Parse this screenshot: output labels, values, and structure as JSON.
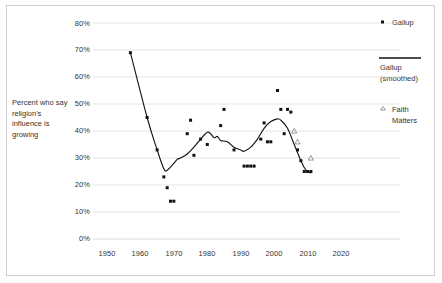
{
  "figure": {
    "background_color": "#ffffff",
    "frame_color": "#cfcfcf",
    "marker_color": "#111111",
    "line_color": "#111111",
    "gridline_color": "#d8d8d8"
  },
  "axes": {
    "y_title": "Percent who say religion's influence is growing",
    "y_ticks": [
      "0%",
      "10%",
      "20%",
      "30%",
      "40%",
      "50%",
      "60%",
      "70%",
      "80%"
    ],
    "x_ticks": [
      "1950",
      "1960",
      "1970",
      "1980",
      "1990",
      "2000",
      "2010",
      "2020"
    ]
  },
  "legend": {
    "items": [
      {
        "label": "Gallup",
        "marker": "square-marker"
      },
      {
        "label": "Gallup (smoothed)",
        "line1": "Gallup",
        "line2": "(smoothed)",
        "marker": "line-marker"
      },
      {
        "label": "Faith Matters",
        "line1": "Faith",
        "line2": "Matters",
        "marker": "triangle-marker"
      }
    ]
  },
  "chart_data": {
    "type": "scatter",
    "title": "",
    "xlabel": "",
    "ylabel": "Percent who say religion's influence is growing",
    "xlim": [
      1950,
      2020
    ],
    "ylim": [
      0,
      80
    ],
    "grid": true,
    "legend_position": "right",
    "series": [
      {
        "name": "Gallup",
        "type": "scatter",
        "marker": "square",
        "points": [
          [
            1957,
            69
          ],
          [
            1962,
            45
          ],
          [
            1965,
            33
          ],
          [
            1967,
            23
          ],
          [
            1968,
            19
          ],
          [
            1969,
            14
          ],
          [
            1970,
            14
          ],
          [
            1974,
            39
          ],
          [
            1975,
            44
          ],
          [
            1976,
            31
          ],
          [
            1978,
            37
          ],
          [
            1980,
            35
          ],
          [
            1984,
            42
          ],
          [
            1985,
            48
          ],
          [
            1988,
            33
          ],
          [
            1991,
            27
          ],
          [
            1992,
            27
          ],
          [
            1993,
            27
          ],
          [
            1994,
            27
          ],
          [
            1996,
            37
          ],
          [
            1997,
            43
          ],
          [
            1998,
            36
          ],
          [
            1999,
            36
          ],
          [
            2001,
            55
          ],
          [
            2002,
            48
          ],
          [
            2003,
            39
          ],
          [
            2004,
            48
          ],
          [
            2005,
            47
          ],
          [
            2007,
            33
          ],
          [
            2008,
            29
          ],
          [
            2009,
            25
          ],
          [
            2010,
            25
          ],
          [
            2011,
            25
          ]
        ]
      },
      {
        "name": "Gallup (smoothed)",
        "type": "line",
        "points": [
          [
            1957,
            69
          ],
          [
            1962,
            45
          ],
          [
            1965,
            33
          ],
          [
            1967,
            26
          ],
          [
            1968,
            25.5
          ],
          [
            1970,
            28
          ],
          [
            1971,
            29.5
          ],
          [
            1972,
            30
          ],
          [
            1974,
            31.5
          ],
          [
            1976,
            34
          ],
          [
            1978,
            37
          ],
          [
            1980,
            39.5
          ],
          [
            1981,
            39
          ],
          [
            1982,
            37.5
          ],
          [
            1983,
            38
          ],
          [
            1984,
            36.5
          ],
          [
            1986,
            36
          ],
          [
            1988,
            34
          ],
          [
            1990,
            33
          ],
          [
            1991,
            32.5
          ],
          [
            1993,
            34
          ],
          [
            1995,
            37
          ],
          [
            1997,
            41
          ],
          [
            1999,
            43.5
          ],
          [
            2001,
            44.5
          ],
          [
            2002,
            44
          ],
          [
            2004,
            41
          ],
          [
            2006,
            35
          ],
          [
            2008,
            29
          ],
          [
            2009,
            26.5
          ],
          [
            2010,
            25
          ],
          [
            2011,
            24.5
          ]
        ]
      },
      {
        "name": "Faith Matters",
        "type": "scatter",
        "marker": "triangle",
        "points": [
          [
            2006,
            40
          ],
          [
            2007,
            36
          ],
          [
            2011,
            30
          ]
        ]
      }
    ]
  }
}
